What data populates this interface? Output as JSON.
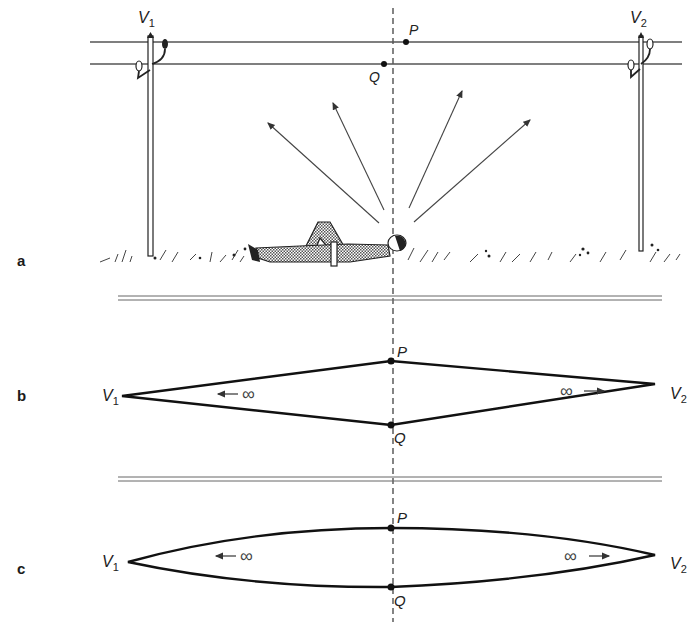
{
  "figure": {
    "panels": [
      {
        "id": "a",
        "label": "a",
        "description": "Person lying on ground looking up at two parallel overhead wires between poles V1 and V2"
      },
      {
        "id": "b",
        "label": "b",
        "description": "Straight-line perspective: wires converge to vanishing points V1 and V2"
      },
      {
        "id": "c",
        "label": "c",
        "description": "Curved perspective: wires appear as curves converging at V1 and V2"
      }
    ],
    "labels": {
      "v1": "V",
      "v1_sub": "1",
      "v2": "V",
      "v2_sub": "2",
      "p": "P",
      "q": "Q",
      "infinity": "∞",
      "arrow_left": "←",
      "arrow_right": "→"
    },
    "colors": {
      "ink": "#1a1a1a",
      "thin_line": "#555555",
      "background": "#ffffff",
      "shading": "#8a8a8a"
    }
  }
}
